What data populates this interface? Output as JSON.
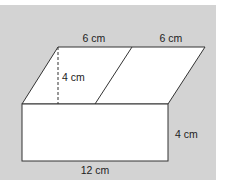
{
  "diagram": {
    "type": "prism-net-figure",
    "background_color": "#d3d3d3",
    "shape_fill": "#ffffff",
    "line_color": "#333333",
    "labels": {
      "top_left_width": "6 cm",
      "top_right_width": "6 cm",
      "parallelogram_height": "4 cm",
      "rectangle_height": "4 cm",
      "rectangle_length": "12 cm"
    }
  }
}
